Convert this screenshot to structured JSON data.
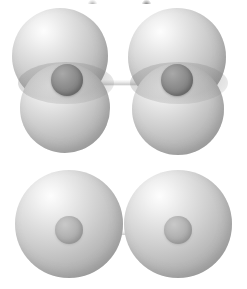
{
  "figure": {
    "title": "Molecular orbital overlap diagram",
    "background_color": "#ffffff",
    "width": 247,
    "height": 289,
    "caption": ""
  },
  "palette": {
    "orbital_light": "#fdfdfd",
    "orbital_mid": "#cfcfcf",
    "orbital_dark": "#9a9a9a",
    "nucleus_dark": "#757575",
    "nucleus_light": "#a6a6a6",
    "bond_highlight": "#ffffff",
    "bond_shade": "#cccccc",
    "overlap_shade": "#828282"
  },
  "crop_remnants": [
    {
      "name": "remnant-1",
      "x": 11
    },
    {
      "name": "remnant-2",
      "x": 88
    },
    {
      "name": "remnant-3",
      "x": 142
    }
  ],
  "molecules": [
    {
      "id": "pi-bond-molecule",
      "label": "Two-lobe (p orbital) atoms forming a pi-type overlap",
      "orbital_type": "p",
      "lobes_per_atom": 2,
      "nucleus_style": "dark",
      "top": 0,
      "height": 155,
      "bond": {
        "label": "internuclear bond",
        "x": 66,
        "y": 74,
        "width": 110,
        "height": 11
      },
      "atoms": [
        {
          "name": "atom-left",
          "label": "Left atom",
          "center_x": 67,
          "lobes": [
            {
              "name": "upper-lobe",
              "x": 12,
              "y": 8,
              "size": 96
            },
            {
              "name": "lower-lobe",
              "x": 20,
              "y": 63,
              "size": 90
            }
          ],
          "overlap": {
            "x": 18,
            "y": 62,
            "width": 96,
            "height": 42
          },
          "nucleus": {
            "x": 51,
            "y": 64,
            "size": 32
          }
        },
        {
          "name": "atom-right",
          "label": "Right atom",
          "center_x": 177,
          "lobes": [
            {
              "name": "upper-lobe",
              "x": 128,
              "y": 8,
              "size": 98
            },
            {
              "name": "lower-lobe",
              "x": 132,
              "y": 63,
              "size": 92
            }
          ],
          "overlap": {
            "x": 130,
            "y": 62,
            "width": 98,
            "height": 42
          },
          "nucleus": {
            "x": 161,
            "y": 64,
            "size": 32
          }
        }
      ]
    },
    {
      "id": "sigma-bond-molecule",
      "label": "Single-sphere (s orbital) atoms forming a sigma bond",
      "orbital_type": "s",
      "lobes_per_atom": 1,
      "nucleus_style": "light",
      "top": 170,
      "height": 119,
      "bond": {
        "label": "internuclear bond",
        "x": 66,
        "y": 56,
        "width": 112,
        "height": 9
      },
      "atoms": [
        {
          "name": "atom-left",
          "label": "Left atom",
          "center_x": 69,
          "lobes": [
            {
              "name": "sphere-lobe",
              "x": 15,
              "y": 0,
              "size": 108
            }
          ],
          "overlap": null,
          "nucleus": {
            "x": 55,
            "y": 46,
            "size": 28
          }
        },
        {
          "name": "atom-right",
          "label": "Right atom",
          "center_x": 178,
          "lobes": [
            {
              "name": "sphere-lobe",
              "x": 124,
              "y": 0,
              "size": 108
            }
          ],
          "overlap": null,
          "nucleus": {
            "x": 164,
            "y": 46,
            "size": 28
          }
        }
      ]
    }
  ]
}
